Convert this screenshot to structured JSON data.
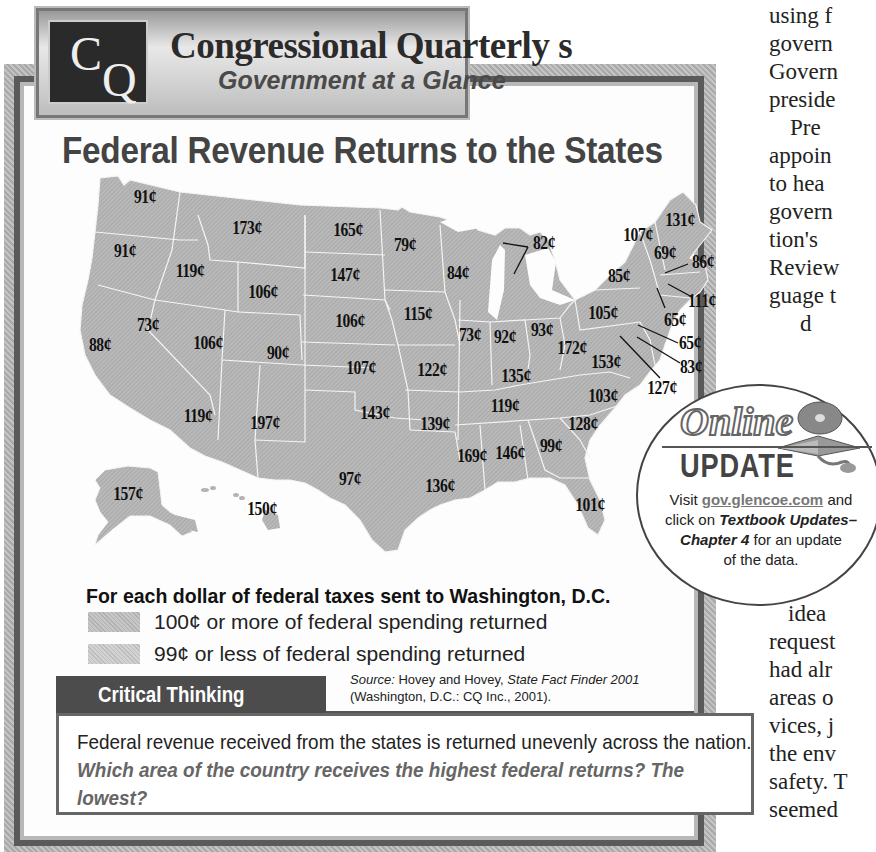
{
  "banner": {
    "logo_c": "C",
    "logo_q": "Q",
    "title": "Congressional Quarterly s",
    "subtitle": "Government at a Glance"
  },
  "map_title": "Federal Revenue Returns to the States",
  "legend": {
    "title": "For each dollar of federal taxes sent to Washington, D.C.",
    "items": [
      {
        "label": "100¢ or more of federal spending returned",
        "color": "#b9b9b9"
      },
      {
        "label": "99¢ or less of federal spending returned",
        "color": "#c8c8c8"
      }
    ]
  },
  "source": {
    "prefix": "Source:",
    "authors": " Hovey and Hovey, ",
    "title": "State Fact Finder 2001",
    "publisher": "(Washington, D.C.: CQ Inc., 2001)."
  },
  "critical_thinking": {
    "header": "Critical Thinking",
    "text": "Federal revenue received from the states is returned unevenly across the nation. ",
    "question": "Which area of the country receives the highest federal returns? The lowest?"
  },
  "online_update": {
    "word1": "Online",
    "word2": "UPDATE",
    "visit": "Visit ",
    "link": "gov.glencoe.com",
    "and": " and",
    "click": "click on ",
    "bold_italic": "Textbook Updates–",
    "chapter": "Chapter 4",
    "rest": " for an update",
    "last": "of the data."
  },
  "side_text": {
    "lines": [
      "using f",
      "govern",
      "Govern",
      "preside",
      "Pre",
      "appoin",
      "to hea",
      "govern",
      "tion's",
      "Review",
      "guage t",
      "d",
      "idea",
      "request",
      "had alr",
      "areas o",
      "vices, j",
      "the env",
      "safety. T",
      "seemed"
    ]
  },
  "chart_data": {
    "type": "choropleth-map",
    "title": "Federal Revenue Returns to the States",
    "subtitle": "For each dollar of federal taxes sent to Washington, D.C.",
    "unit": "cents returned per dollar",
    "legend": [
      "100¢ or more of federal spending returned",
      "99¢ or less of federal spending returned"
    ],
    "source": "Hovey and Hovey, State Fact Finder 2001 (Washington, D.C.: CQ Inc., 2001).",
    "states": [
      {
        "state": "WA",
        "value": 91,
        "label": "91¢",
        "x": 145,
        "y": 197
      },
      {
        "state": "OR",
        "value": 91,
        "label": "91¢",
        "x": 125,
        "y": 251
      },
      {
        "state": "CA",
        "value": 88,
        "label": "88¢",
        "x": 100,
        "y": 345
      },
      {
        "state": "NV",
        "value": 73,
        "label": "73¢",
        "x": 148,
        "y": 325
      },
      {
        "state": "ID",
        "value": 119,
        "label": "119¢",
        "x": 190,
        "y": 271
      },
      {
        "state": "MT",
        "value": 173,
        "label": "173¢",
        "x": 247,
        "y": 228
      },
      {
        "state": "WY",
        "value": 106,
        "label": "106¢",
        "x": 263,
        "y": 292
      },
      {
        "state": "UT",
        "value": 106,
        "label": "106¢",
        "x": 208,
        "y": 343
      },
      {
        "state": "CO",
        "value": 90,
        "label": "90¢",
        "x": 278,
        "y": 353
      },
      {
        "state": "AZ",
        "value": 119,
        "label": "119¢",
        "x": 198,
        "y": 416
      },
      {
        "state": "NM",
        "value": 197,
        "label": "197¢",
        "x": 265,
        "y": 423
      },
      {
        "state": "ND",
        "value": 165,
        "label": "165¢",
        "x": 348,
        "y": 230
      },
      {
        "state": "SD",
        "value": 147,
        "label": "147¢",
        "x": 345,
        "y": 275
      },
      {
        "state": "NE",
        "value": 106,
        "label": "106¢",
        "x": 350,
        "y": 321
      },
      {
        "state": "KS",
        "value": 107,
        "label": "107¢",
        "x": 361,
        "y": 368
      },
      {
        "state": "OK",
        "value": 143,
        "label": "143¢",
        "x": 375,
        "y": 413
      },
      {
        "state": "TX",
        "value": 97,
        "label": "97¢",
        "x": 350,
        "y": 479
      },
      {
        "state": "MN",
        "value": 79,
        "label": "79¢",
        "x": 405,
        "y": 245
      },
      {
        "state": "WI",
        "value": 84,
        "label": "84¢",
        "x": 458,
        "y": 273
      },
      {
        "state": "IA",
        "value": 115,
        "label": "115¢",
        "x": 418,
        "y": 314
      },
      {
        "state": "MO",
        "value": 122,
        "label": "122¢",
        "x": 432,
        "y": 370
      },
      {
        "state": "AR",
        "value": 139,
        "label": "139¢",
        "x": 435,
        "y": 424
      },
      {
        "state": "LA",
        "value": 136,
        "label": "136¢",
        "x": 440,
        "y": 486
      },
      {
        "state": "IL",
        "value": 73,
        "label": "73¢",
        "x": 470,
        "y": 335
      },
      {
        "state": "IN",
        "value": 92,
        "label": "92¢",
        "x": 505,
        "y": 337
      },
      {
        "state": "OH",
        "value": 93,
        "label": "93¢",
        "x": 542,
        "y": 330
      },
      {
        "state": "MI",
        "value": 82,
        "label": "82¢",
        "x": 544,
        "y": 243
      },
      {
        "state": "KY",
        "value": 135,
        "label": "135¢",
        "x": 516,
        "y": 376
      },
      {
        "state": "TN",
        "value": 119,
        "label": "119¢",
        "x": 505,
        "y": 406
      },
      {
        "state": "MS",
        "value": 169,
        "label": "169¢",
        "x": 472,
        "y": 456
      },
      {
        "state": "AL",
        "value": 146,
        "label": "146¢",
        "x": 510,
        "y": 453
      },
      {
        "state": "GA",
        "value": 99,
        "label": "99¢",
        "x": 551,
        "y": 446
      },
      {
        "state": "FL",
        "value": 101,
        "label": "101¢",
        "x": 590,
        "y": 505
      },
      {
        "state": "SC",
        "value": 128,
        "label": "128¢",
        "x": 583,
        "y": 424
      },
      {
        "state": "NC",
        "value": 103,
        "label": "103¢",
        "x": 603,
        "y": 396
      },
      {
        "state": "VA",
        "value": 153,
        "label": "153¢",
        "x": 606,
        "y": 362
      },
      {
        "state": "WV",
        "value": 172,
        "label": "172¢",
        "x": 572,
        "y": 348
      },
      {
        "state": "PA",
        "value": 105,
        "label": "105¢",
        "x": 603,
        "y": 313
      },
      {
        "state": "NY",
        "value": 85,
        "label": "85¢",
        "x": 619,
        "y": 276
      },
      {
        "state": "VT",
        "value": 107,
        "label": "107¢",
        "x": 638,
        "y": 235
      },
      {
        "state": "NH",
        "value": 69,
        "label": "69¢",
        "x": 665,
        "y": 253
      },
      {
        "state": "ME",
        "value": 131,
        "label": "131¢",
        "x": 680,
        "y": 220
      },
      {
        "state": "MA",
        "value": 86,
        "label": "86¢",
        "x": 703,
        "y": 262
      },
      {
        "state": "RI",
        "value": 111,
        "label": "111¢",
        "x": 702,
        "y": 301
      },
      {
        "state": "CT",
        "value": 65,
        "label": "65¢",
        "x": 675,
        "y": 320
      },
      {
        "state": "NJ",
        "value": 65,
        "label": "65¢",
        "x": 690,
        "y": 343
      },
      {
        "state": "DE",
        "value": 83,
        "label": "83¢",
        "x": 691,
        "y": 367
      },
      {
        "state": "MD",
        "value": 127,
        "label": "127¢",
        "x": 662,
        "y": 388
      },
      {
        "state": "AK",
        "value": 157,
        "label": "157¢",
        "x": 128,
        "y": 494
      },
      {
        "state": "HI",
        "value": 150,
        "label": "150¢",
        "x": 262,
        "y": 509
      }
    ]
  }
}
